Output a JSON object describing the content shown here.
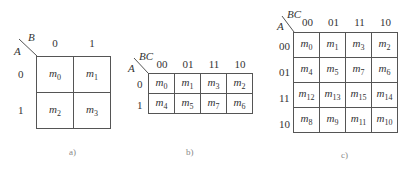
{
  "maps": [
    {
      "id": "a",
      "row_var": "A",
      "col_var": "B",
      "col_labels": [
        "0",
        "1"
      ],
      "row_labels": [
        "0",
        "1"
      ],
      "cells": [
        [
          "0",
          "1"
        ],
        [
          "2",
          "3"
        ]
      ],
      "caption": "a)"
    },
    {
      "id": "b",
      "row_var": "A",
      "col_var": "BC",
      "col_labels": [
        "00",
        "01",
        "11",
        "10"
      ],
      "row_labels": [
        "0",
        "1"
      ],
      "cells": [
        [
          "0",
          "1",
          "3",
          "2"
        ],
        [
          "4",
          "5",
          "7",
          "6"
        ]
      ],
      "caption": "b)"
    },
    {
      "id": "c",
      "row_var": "A",
      "col_var": "BC",
      "col_labels": [
        "00",
        "01",
        "11",
        "10"
      ],
      "row_labels": [
        "00",
        "01",
        "11",
        "10"
      ],
      "cells": [
        [
          "0",
          "1",
          "3",
          "2"
        ],
        [
          "4",
          "5",
          "7",
          "6"
        ],
        [
          "12",
          "13",
          "15",
          "14"
        ],
        [
          "8",
          "9",
          "11",
          "10"
        ]
      ],
      "caption": "c)"
    }
  ],
  "minterm_symbol": "m"
}
